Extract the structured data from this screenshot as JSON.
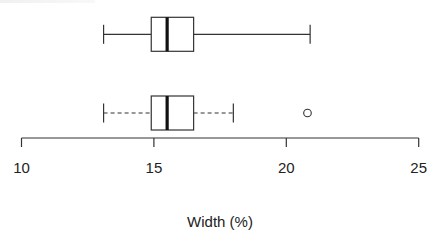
{
  "chart_data": {
    "type": "boxplot",
    "orientation": "horizontal",
    "title": "",
    "xlabel": "Width (%)",
    "ylabel": "",
    "xlim": [
      10,
      25
    ],
    "x_ticks": [
      10,
      15,
      20,
      25
    ],
    "x_tick_labels": [
      "10",
      "15",
      "20",
      "25"
    ],
    "grid": false,
    "legend": null,
    "series": [
      {
        "name": "top",
        "whisker_style": "solid",
        "whisker_low": 13.1,
        "q1": 14.9,
        "median": 15.5,
        "q3": 16.5,
        "whisker_high": 20.9,
        "outliers": []
      },
      {
        "name": "bottom",
        "whisker_style": "dashed",
        "whisker_low": 13.1,
        "q1": 14.9,
        "median": 15.5,
        "q3": 16.5,
        "whisker_high": 18.0,
        "outliers": [
          20.8
        ]
      }
    ]
  },
  "colors": {
    "stroke": "#333333",
    "median": "#111111",
    "background": "#ffffff"
  }
}
